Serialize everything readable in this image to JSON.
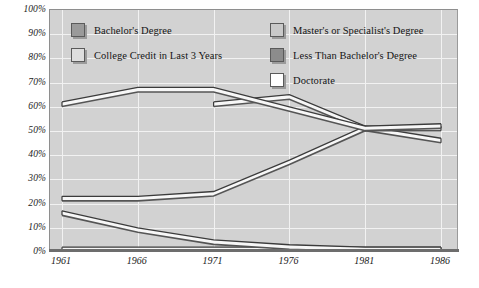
{
  "chart_data": {
    "type": "line",
    "title": "",
    "subtitle": "",
    "xlabel": "",
    "ylabel": "",
    "categories": [
      "1961",
      "1966",
      "1971",
      "1976",
      "1981",
      "1986"
    ],
    "x_tick_labels": [
      "1961",
      "1966",
      "1971",
      "1976",
      "1981",
      "1986"
    ],
    "y_tick_labels": [
      "100%",
      "90%",
      "80%",
      "70%",
      "60%",
      "50%",
      "40%",
      "30%",
      "20%",
      "10%",
      "0%"
    ],
    "y_tick_values": [
      100,
      90,
      80,
      70,
      60,
      50,
      40,
      30,
      20,
      10,
      0
    ],
    "ylim": [
      0,
      100
    ],
    "grid": true,
    "grid_color": "#f2f2f2",
    "plot_background": "#d2d2d2",
    "legend_position": "inside-top",
    "series": [
      {
        "name": "Less Than Bachelor's Degree",
        "swatch_color": "#8c8c8c",
        "values": [
          62,
          68,
          68,
          60,
          52,
          53
        ]
      },
      {
        "name": "Master's or Specialist's Degree",
        "swatch_color": "#c9c9c9",
        "values": [
          null,
          null,
          62,
          65,
          52,
          52
        ]
      },
      {
        "name": "Bachelor's Degree",
        "swatch_color": "#9a9a9a",
        "values": [
          23,
          23,
          25,
          38,
          52,
          47
        ]
      },
      {
        "name": "College Credit in Last 3 Years",
        "swatch_color": "#dedede",
        "values": [
          17,
          10,
          5,
          3,
          2,
          2
        ]
      },
      {
        "name": "Doctorate",
        "swatch_color": "#ffffff",
        "values": [
          2,
          2,
          2,
          2,
          2,
          2
        ]
      }
    ]
  },
  "legend": {
    "entries": [
      {
        "label": "Bachelor's Degree",
        "color": "#9a9a9a"
      },
      {
        "label": "College Credit in Last 3 Years",
        "color": "#dedede"
      },
      {
        "label": "Master's or Specialist's Degree",
        "color": "#c9c9c9"
      },
      {
        "label": "Less Than Bachelor's Degree",
        "color": "#8c8c8c"
      },
      {
        "label": "Doctorate",
        "color": "#ffffff"
      }
    ]
  }
}
